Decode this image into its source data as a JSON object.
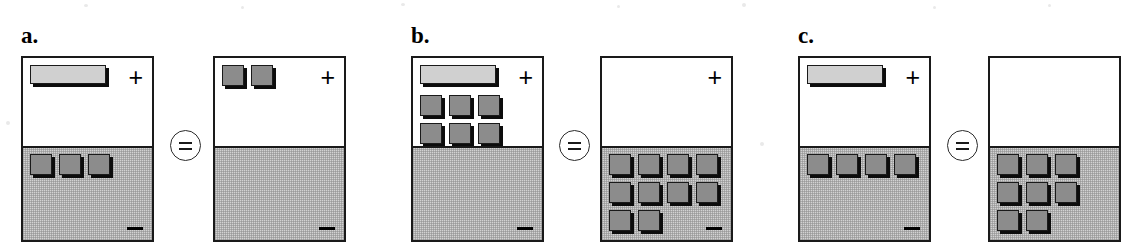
{
  "figure": {
    "type": "algebra-tile-balance-diagram",
    "operator_symbol": "=",
    "plus_symbol": "+",
    "minus_symbol": "–",
    "colors": {
      "bar_tile": "#d0d0d0",
      "unit_tile": "#8c8c8c",
      "tile_shadow": "#0c0c0c",
      "negative_region": "#d2d2d2",
      "positive_region": "#ffffff",
      "outline": "#1a1a1a"
    },
    "panels": [
      {
        "label": "a.",
        "left_box": {
          "name": "left-balance-box",
          "plus_region": {
            "bars": 1,
            "units": 0
          },
          "minus_region": {
            "bars": 0,
            "units": 3
          }
        },
        "right_box": {
          "name": "right-balance-box",
          "plus_region": {
            "bars": 0,
            "units": 2
          },
          "minus_region": {
            "bars": 0,
            "units": 0
          }
        }
      },
      {
        "label": "b.",
        "left_box": {
          "name": "left-balance-box",
          "plus_region": {
            "bars": 1,
            "units": 6
          },
          "minus_region": {
            "bars": 0,
            "units": 0
          }
        },
        "right_box": {
          "name": "right-balance-box",
          "plus_region": {
            "bars": 0,
            "units": 0
          },
          "minus_region": {
            "bars": 0,
            "units": 10
          }
        }
      },
      {
        "label": "c.",
        "left_box": {
          "name": "left-balance-box",
          "plus_region": {
            "bars": 1,
            "units": 0
          },
          "minus_region": {
            "bars": 0,
            "units": 4
          }
        },
        "right_box": {
          "name": "right-balance-box",
          "plus_region": {
            "bars": 0,
            "units": 0
          },
          "minus_region": {
            "bars": 0,
            "units": 8
          },
          "clipped_at_image_edge": true
        }
      }
    ]
  }
}
